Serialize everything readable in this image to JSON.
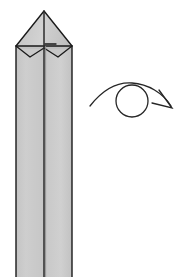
{
  "figure": {
    "domain_kind": "origami-instruction-diagram",
    "canvas": {
      "width": 183,
      "height": 277,
      "background": "#ffffff"
    },
    "colors": {
      "paper_front": "#cccccc",
      "paper_front_alt": "#c9c9c9",
      "paper_shadow": "#b8b8b8",
      "paper_highlight": "#d6d6d6",
      "outline": "#1a1a1a",
      "crease": "#2b2b2b",
      "arrow": "#262626",
      "background": "#ffffff"
    },
    "stroke_widths": {
      "outline": 1.4,
      "crease": 1.1,
      "arrow": 1.3
    }
  },
  "model": {
    "name": "folded-paper-column",
    "description": "A long vertical four-panel column of folded paper, closed at the top into a symmetrical point, running off the bottom edge of the frame.",
    "shaft": {
      "left_edge_x": 16,
      "right_edge_x": 72,
      "center_fold_x": 44,
      "top_y": 46,
      "bottom_y": 277,
      "width": 56,
      "panels": [
        {
          "name": "left-panel",
          "x_from": 16,
          "x_to": 44,
          "fill": "#cccccc"
        },
        {
          "name": "right-panel",
          "x_from": 44,
          "x_to": 72,
          "fill": "#c9c9c9"
        }
      ]
    },
    "apex": {
      "x": 44,
      "y": 11
    },
    "top_flaps": {
      "left_triangle": "apex down-left to (16,46)",
      "right_triangle": "apex down-right to (72,46)",
      "inner_vertical_crease": "apex straight down to (44,46)"
    },
    "lower_notch": {
      "description": "Two shallow V-shaped folded flaps below the wide horizontal crease, meeting at the center",
      "left_v": [
        [
          16,
          46
        ],
        [
          30,
          57
        ],
        [
          44,
          48
        ]
      ],
      "right_v": [
        [
          44,
          48
        ],
        [
          58,
          57
        ],
        [
          72,
          46
        ]
      ],
      "center_tab_y": 48
    },
    "short_tick": {
      "description": "Small horizontal crease mark just right of the center line",
      "x_from": 45,
      "x_to": 56,
      "y": 44
    }
  },
  "symbols": {
    "turn_over_arrow": {
      "name": "turn-over-rotate-arrow",
      "meaning": "Turn the model over / rotate it around",
      "circle": {
        "cx": 132,
        "cy": 101,
        "r": 16
      },
      "curve_start": {
        "x": 90,
        "y": 106
      },
      "curve_end": {
        "x": 172,
        "y": 107
      },
      "curve_peak_y": 83,
      "arrowhead": {
        "tip_x": 172,
        "tip_y": 107,
        "direction": "down-right"
      }
    }
  },
  "labels": {
    "step_number": "",
    "caption": ""
  }
}
